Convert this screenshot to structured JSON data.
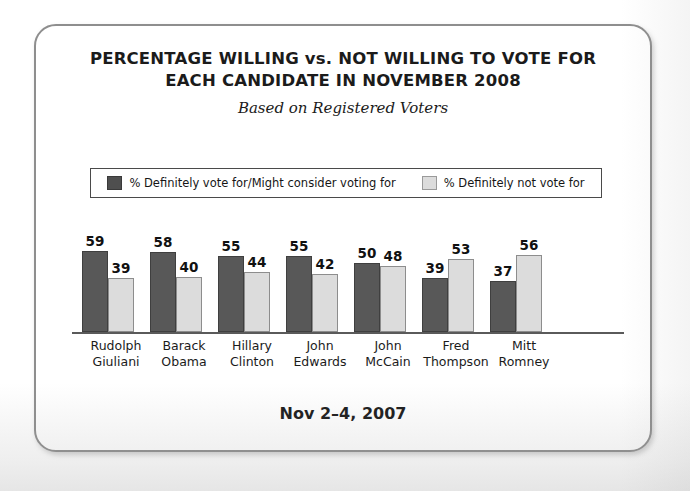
{
  "card": {
    "title_line_1": "PERCENTAGE WILLING vs. NOT WILLING TO VOTE FOR",
    "title_line_2": "EACH CANDIDATE IN NOVEMBER 2008",
    "subtitle": "Based on Registered Voters",
    "footer_date": "Nov 2–4, 2007"
  },
  "legend": {
    "items": [
      {
        "label": "% Definitely vote for/Might consider voting for",
        "color": "#585858",
        "swatch": "dark-swatch-icon"
      },
      {
        "label": "% Definitely not vote for",
        "color": "#dcdcdc",
        "swatch": "light-swatch-icon"
      }
    ]
  },
  "colors": {
    "series_1": "#585858",
    "series_2": "#dcdcdc",
    "card_border": "#8e8e8e",
    "baseline": "#5a5a5a",
    "text": "#1b1b1b"
  },
  "chart_data": {
    "type": "bar",
    "title": "PERCENTAGE WILLING vs. NOT WILLING TO VOTE FOR EACH CANDIDATE IN NOVEMBER 2008",
    "subtitle": "Based on Registered Voters",
    "annotation": "Nov 2–4, 2007",
    "xlabel": "",
    "ylabel": "",
    "ylim": [
      0,
      60
    ],
    "grid": false,
    "legend_position": "top",
    "categories": [
      "Rudolph Giuliani",
      "Barack Obama",
      "Hillary Clinton",
      "John Edwards",
      "John McCain",
      "Fred Thompson",
      "Mitt Romney"
    ],
    "category_lines": [
      [
        "Rudolph",
        "Giuliani"
      ],
      [
        "Barack",
        "Obama"
      ],
      [
        "Hillary",
        "Clinton"
      ],
      [
        "John",
        "Edwards"
      ],
      [
        "John",
        "McCain"
      ],
      [
        "Fred",
        "Thompson"
      ],
      [
        "Mitt",
        "Romney"
      ]
    ],
    "series": [
      {
        "name": "% Definitely vote for/Might consider voting for",
        "color": "#585858",
        "values": [
          59,
          58,
          55,
          55,
          50,
          39,
          37
        ]
      },
      {
        "name": "% Definitely not vote for",
        "color": "#dcdcdc",
        "values": [
          39,
          40,
          44,
          42,
          48,
          53,
          56
        ]
      }
    ]
  }
}
